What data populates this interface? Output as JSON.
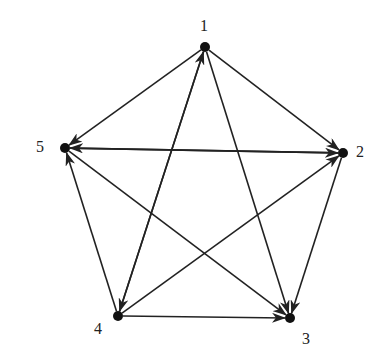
{
  "diagram": {
    "type": "directed-graph",
    "nodes": [
      {
        "id": "1",
        "label": "1",
        "x": 205,
        "y": 47,
        "lx": 200,
        "ly": 17
      },
      {
        "id": "2",
        "label": "2",
        "x": 343,
        "y": 153,
        "lx": 356,
        "ly": 143
      },
      {
        "id": "3",
        "label": "3",
        "x": 290,
        "y": 318,
        "lx": 302,
        "ly": 330
      },
      {
        "id": "4",
        "label": "4",
        "x": 118,
        "y": 316,
        "lx": 94,
        "ly": 320
      },
      {
        "id": "5",
        "label": "5",
        "x": 65,
        "y": 148,
        "lx": 36,
        "ly": 138
      }
    ],
    "edges": [
      {
        "from": "1",
        "to": "2"
      },
      {
        "from": "1",
        "to": "5"
      },
      {
        "from": "1",
        "to": "3"
      },
      {
        "from": "1",
        "to": "4"
      },
      {
        "from": "4",
        "to": "1"
      },
      {
        "from": "2",
        "to": "5"
      },
      {
        "from": "5",
        "to": "2"
      },
      {
        "from": "2",
        "to": "3"
      },
      {
        "from": "4",
        "to": "2"
      },
      {
        "from": "5",
        "to": "3"
      },
      {
        "from": "4",
        "to": "3"
      },
      {
        "from": "4",
        "to": "5"
      }
    ],
    "colors": {
      "stroke": "#222222",
      "node": "#111111",
      "background": "#ffffff"
    }
  }
}
